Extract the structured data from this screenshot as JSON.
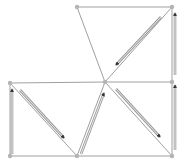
{
  "diagram": {
    "type": "triangulated-grid-with-flow-arrows",
    "colors": {
      "background": "#ffffff",
      "edge": "#a0a0a0",
      "node": "#b4b4b4",
      "arrow_outline": "#9a9a9a",
      "arrow_fill": "#333333"
    },
    "nodes": [
      {
        "id": "n-top-left",
        "x": 77,
        "y": 7
      },
      {
        "id": "n-top-right",
        "x": 172,
        "y": 7
      },
      {
        "id": "n-mid-left",
        "x": 10,
        "y": 83
      },
      {
        "id": "n-center",
        "x": 105,
        "y": 82
      },
      {
        "id": "n-mid-right",
        "x": 172,
        "y": 82
      },
      {
        "id": "n-bottom-left",
        "x": 10,
        "y": 156
      },
      {
        "id": "n-bottom-mid",
        "x": 77,
        "y": 156
      },
      {
        "id": "n-bottom-right",
        "x": 172,
        "y": 156
      }
    ],
    "edges": [
      [
        "n-top-left",
        "n-top-right"
      ],
      [
        "n-top-left",
        "n-center"
      ],
      [
        "n-top-right",
        "n-center"
      ],
      [
        "n-top-right",
        "n-mid-right"
      ],
      [
        "n-mid-left",
        "n-center"
      ],
      [
        "n-center",
        "n-mid-right"
      ],
      [
        "n-mid-left",
        "n-bottom-left"
      ],
      [
        "n-mid-left",
        "n-bottom-mid"
      ],
      [
        "n-center",
        "n-bottom-mid"
      ],
      [
        "n-center",
        "n-bottom-right"
      ],
      [
        "n-mid-right",
        "n-bottom-right"
      ],
      [
        "n-bottom-left",
        "n-bottom-mid"
      ],
      [
        "n-bottom-mid",
        "n-bottom-right"
      ]
    ],
    "arrows": [
      {
        "id": "arrow-top-diagonal",
        "x1": 161,
        "y1": 17,
        "x2": 116,
        "y2": 65
      },
      {
        "id": "arrow-right-upper-vertical",
        "x1": 175,
        "y1": 75,
        "x2": 175,
        "y2": 13
      },
      {
        "id": "arrow-right-lower-vertical",
        "x1": 175,
        "y1": 150,
        "x2": 175,
        "y2": 85
      },
      {
        "id": "arrow-left-vertical",
        "x1": 12,
        "y1": 154,
        "x2": 12,
        "y2": 89
      },
      {
        "id": "arrow-left-diagonal",
        "x1": 20,
        "y1": 90,
        "x2": 64,
        "y2": 138
      },
      {
        "id": "arrow-center-up-diagonal",
        "x1": 81,
        "y1": 154,
        "x2": 104,
        "y2": 93
      },
      {
        "id": "arrow-right-diagonal",
        "x1": 116,
        "y1": 89,
        "x2": 160,
        "y2": 137
      }
    ]
  }
}
